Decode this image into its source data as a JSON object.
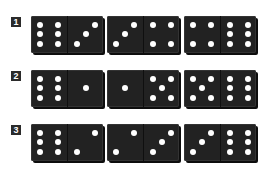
{
  "rows": [
    {
      "label": "1",
      "dominoes": [
        {
          "left": 6,
          "right": 3
        },
        {
          "left": 3,
          "right": 4
        },
        {
          "left": 4,
          "right": 6
        }
      ]
    },
    {
      "label": "2",
      "dominoes": [
        {
          "left": 6,
          "right": 1
        },
        {
          "left": 1,
          "right": 5
        },
        {
          "left": 5,
          "right": 6
        }
      ]
    },
    {
      "label": "3",
      "dominoes": [
        {
          "left": 6,
          "right": 2
        },
        {
          "left": 2,
          "right": 3
        },
        {
          "left": 3,
          "right": 6
        }
      ]
    }
  ],
  "colors": {
    "domino": "#222222",
    "pip": "#ffffff",
    "label_bg": "#2b2b2b"
  }
}
